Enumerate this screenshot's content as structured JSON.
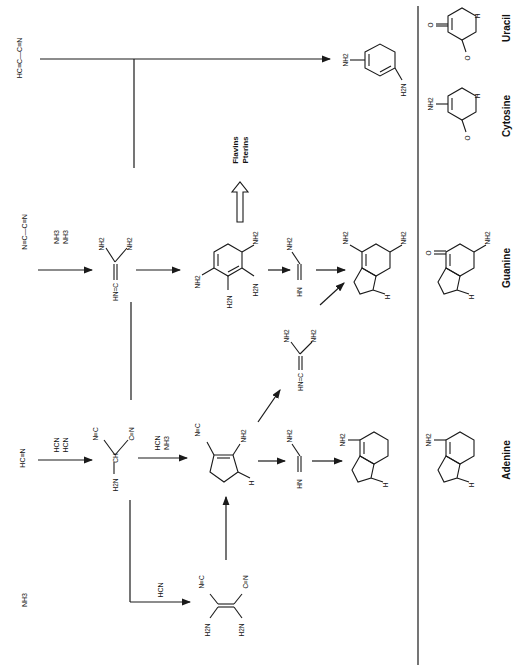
{
  "diagram": {
    "orientation": "rotated-90-clockwise",
    "colors": {
      "ink": "#1a1a1a",
      "background": "#ffffff"
    },
    "starting_materials": {
      "cyanoacetylene": "HC≡C—C≡N",
      "cyanogen": "N≡C—C≡N",
      "hydrogen_cyanide": "HC≡N",
      "ammonia": "NH3"
    },
    "reagents": {
      "cyanogen_step": [
        "NH3",
        "NH3"
      ],
      "hcn_trimer_step": [
        "HCN",
        "HCN"
      ],
      "aminomalononitrile_step": [
        "HCN",
        "NH3"
      ],
      "ammonia_step": [
        "HCN"
      ]
    },
    "intermediates": {
      "guanidine": {
        "labels": [
          "NH2",
          "NH2",
          "HN=C"
        ]
      },
      "aminomalononitrile": {
        "labels": [
          "N≡C",
          "C≡N",
          "CH",
          "H2N"
        ]
      },
      "diaminomaleonitrile": {
        "labels": [
          "N≡C",
          "C≡N",
          "H2N",
          "H2N"
        ]
      },
      "aminoimidazole_carbonitrile": {
        "labels": [
          "N≡C",
          "NH2",
          "N",
          "N",
          "H"
        ]
      },
      "formamidine_1": {
        "labels": [
          "NH2",
          "HN"
        ]
      },
      "formamidine_2": {
        "labels": [
          "NH2",
          "HN"
        ]
      },
      "guanidine_2": {
        "labels": [
          "NH2",
          "NH2",
          "HN=C"
        ]
      },
      "tetraaminopyrimidine": {
        "labels": [
          "NH2",
          "NH2",
          "H2N",
          "H2N",
          "N",
          "N"
        ]
      },
      "diaminopyrimidine": {
        "labels": [
          "NH2",
          "H2N",
          "N",
          "N"
        ]
      }
    },
    "side_products": {
      "line1": "Flavins",
      "line2": "Pterins"
    },
    "products_left": {
      "diaminopurine": {
        "labels": [
          "NH2",
          "NH2",
          "N",
          "N",
          "N",
          "N",
          "H"
        ]
      },
      "adenine_synth": {
        "labels": [
          "NH2",
          "N",
          "N",
          "N",
          "N",
          "H"
        ]
      }
    },
    "nucleobases": [
      {
        "name": "Uracil",
        "labels": [
          "O",
          "O",
          "HN",
          "N",
          "H"
        ]
      },
      {
        "name": "Cytosine",
        "labels": [
          "NH2",
          "O",
          "N",
          "N",
          "H"
        ]
      },
      {
        "name": "Guanine",
        "labels": [
          "O",
          "NH",
          "NH2",
          "N",
          "N",
          "N",
          "H"
        ]
      },
      {
        "name": "Adenine",
        "labels": [
          "NH2",
          "N",
          "N",
          "N",
          "N",
          "H"
        ]
      }
    ]
  }
}
